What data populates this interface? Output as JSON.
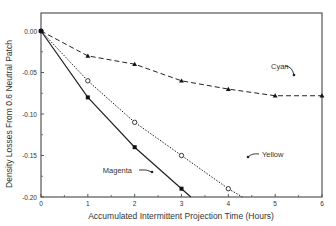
{
  "chart_data": {
    "type": "line",
    "title": "",
    "xlabel": "Accumulated Intermittent Projection Time (Hours)",
    "ylabel": "Density Losses From 0.6 Neutral Patch",
    "xlim": [
      0,
      6
    ],
    "ylim": [
      -0.2,
      0.02
    ],
    "xticks": [
      "0",
      "1",
      "2",
      "3",
      "4",
      "5",
      "6"
    ],
    "yticks": [
      "0.00",
      "-0.05",
      "-0.10",
      "-0.15",
      "-0.20"
    ],
    "ytick_values": [
      0.0,
      -0.05,
      -0.1,
      -0.15,
      -0.2
    ],
    "grid": false,
    "legend": "inline annotations with arrows",
    "series": [
      {
        "name": "Cyan",
        "style": "dashed",
        "marker": "filled-triangle",
        "x": [
          0,
          1,
          2,
          3,
          4,
          5,
          6
        ],
        "values": [
          0.0,
          -0.03,
          -0.04,
          -0.06,
          -0.07,
          -0.078,
          -0.078
        ]
      },
      {
        "name": "Yellow",
        "style": "dotted",
        "marker": "open-circle",
        "x": [
          0,
          1,
          2,
          3,
          4,
          4.3
        ],
        "values": [
          0.0,
          -0.06,
          -0.11,
          -0.15,
          -0.19,
          -0.2
        ]
      },
      {
        "name": "Magenta",
        "style": "solid",
        "marker": "filled-square",
        "x": [
          0,
          1,
          2,
          3,
          3.2
        ],
        "values": [
          0.0,
          -0.08,
          -0.14,
          -0.19,
          -0.2
        ]
      }
    ],
    "annotations": [
      {
        "text": "Cyan",
        "x": 4.95,
        "y": -0.048
      },
      {
        "text": "Yellow",
        "x": 3.6,
        "y": -0.135
      },
      {
        "text": "Magenta",
        "x": 1.9,
        "y": -0.175
      }
    ]
  }
}
